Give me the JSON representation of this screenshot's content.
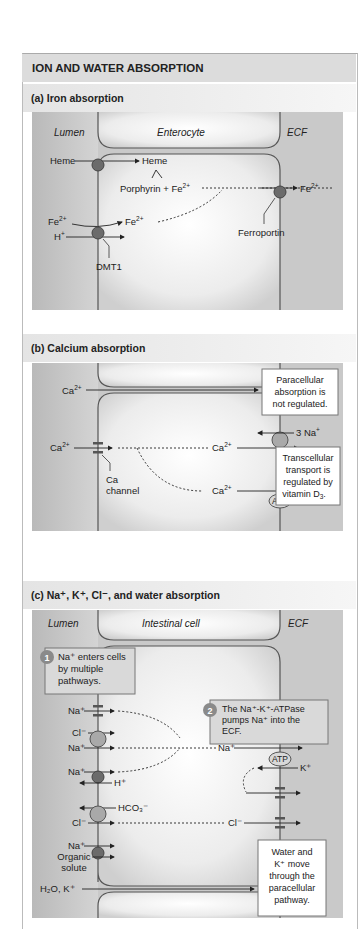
{
  "title": "ION AND WATER ABSORPTION",
  "sections": {
    "a": {
      "title": "(a) Iron absorption",
      "regions": {
        "lumen": "Lumen",
        "cell": "Enterocyte",
        "ecf": "ECF"
      },
      "labels": {
        "heme_in": "Heme",
        "heme_cell": "Heme",
        "porphyrin": "Porphyrin + Fe",
        "fe_lumen": "Fe",
        "fe_cell": "Fe",
        "h_plus": "H",
        "fe_out": "Fe",
        "ferroportin": "Ferroportin",
        "dmt1": "DMT1",
        "sup_2plus": "2+",
        "sup_plus": "+"
      }
    },
    "b": {
      "title": "(b) Calcium absorption",
      "labels": {
        "ca_para": "Ca",
        "ca_lumen": "Ca",
        "ca_cell_1": "Ca",
        "ca_cell_2": "Ca",
        "na3": "3 Na",
        "atp": "ATP",
        "ca_channel_1": "Ca",
        "ca_channel_2": "channel",
        "sup_2plus": "2+",
        "sup_plus": "+"
      },
      "callouts": {
        "paracellular": [
          "Paracellular",
          "absorption is",
          "not regulated."
        ],
        "transcellular": [
          "Transcellular",
          "transport is",
          "regulated by",
          "vitamin D"
        ],
        "d_sub": "3"
      }
    },
    "c": {
      "title": "(c) Na⁺, K⁺, Cl⁻, and water absorption",
      "regions": {
        "lumen": "Lumen",
        "cell": "Intestinal cell",
        "ecf": "ECF"
      },
      "steps": [
        {
          "num": "1",
          "lines": [
            "Na⁺ enters cells",
            "by multiple",
            "pathways."
          ]
        },
        {
          "num": "2",
          "lines": [
            "The Na⁺-K⁺-ATPase",
            "pumps Na⁺ into the",
            "ECF."
          ]
        }
      ],
      "labels": {
        "na1": "Na⁺",
        "cl1": "Cl⁻",
        "na2": "Na⁺",
        "na3": "Na⁺",
        "h": "H⁺",
        "hco3": "HCO₃⁻",
        "cl2": "Cl⁻",
        "na4": "Na⁺",
        "organic_1": "Organic",
        "organic_2": "solute",
        "water": "H₂O, K⁺",
        "na_cell": "Na⁺",
        "atp": "ATP",
        "k": "K⁺",
        "cl_cell": "Cl⁻"
      },
      "callout": [
        "Water and",
        "K⁺ move",
        "through the",
        "paracellular",
        "pathway."
      ]
    }
  },
  "colors": {
    "panel_bg": "#c9c9c9",
    "cell_fill": "#ededed",
    "membrane": "#555555",
    "transporter_dark": "#6b6b6b",
    "transporter_light": "#a9a9a9",
    "step_badge": "#8a8a8a",
    "header_bg": "#dcdcdc"
  }
}
